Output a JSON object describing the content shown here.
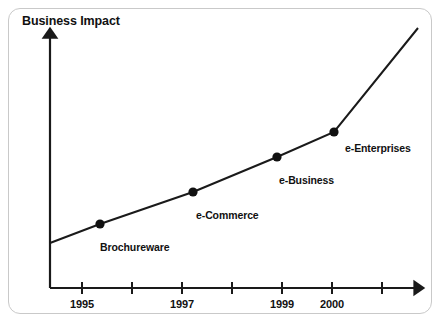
{
  "chart_data": {
    "type": "line",
    "title": "",
    "ylabel": "Business Impact",
    "xlabel": "",
    "grid": false,
    "legend": "none",
    "axis_arrows": true,
    "x_ticks": [
      {
        "value": 1995,
        "label": "1995",
        "px": 82
      },
      {
        "value": 1996,
        "label": "",
        "px": 132
      },
      {
        "value": 1997,
        "label": "1997",
        "px": 182
      },
      {
        "value": 1998,
        "label": "",
        "px": 232
      },
      {
        "value": 1999,
        "label": "1999",
        "px": 282
      },
      {
        "value": 2000,
        "label": "2000",
        "px": 332
      },
      {
        "value": 2001,
        "label": "",
        "px": 382
      }
    ],
    "x_tick_labels": [
      "1995",
      "1997",
      "1999",
      "2000"
    ],
    "series": [
      {
        "name": "Business Impact over time",
        "points": [
          {
            "label": "",
            "x": 50,
            "y": 243,
            "marker": false
          },
          {
            "label": "Brochureware",
            "x": 100,
            "y": 224,
            "marker": true
          },
          {
            "label": "e-Commerce",
            "x": 193,
            "y": 192,
            "marker": true
          },
          {
            "label": "e-Business",
            "x": 277,
            "y": 157,
            "marker": true
          },
          {
            "label": "e-Enterprises",
            "x": 334,
            "y": 132,
            "marker": true
          },
          {
            "label": "",
            "x": 418,
            "y": 28,
            "marker": false
          }
        ]
      }
    ],
    "annotations": [
      {
        "text": "Brochureware",
        "x": 100,
        "y": 241
      },
      {
        "text": "e-Commerce",
        "x": 196,
        "y": 209
      },
      {
        "text": "e-Business",
        "x": 279,
        "y": 174
      },
      {
        "text": "e-Enterprises",
        "x": 345,
        "y": 142
      }
    ]
  },
  "colors": {
    "line": "#1a1a1a",
    "marker": "#111111",
    "axis": "#1a1a1a",
    "border": "#c9c9c9",
    "text": "#111111",
    "background": "#ffffff"
  }
}
